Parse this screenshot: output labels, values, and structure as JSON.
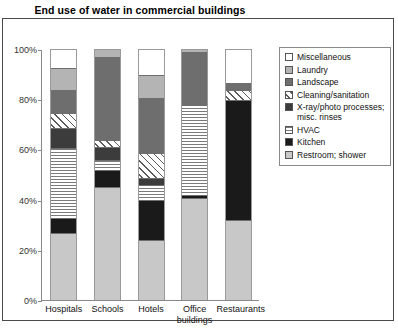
{
  "chart_data": {
    "type": "bar",
    "subtype": "stacked-percent",
    "title": "End use of water in commercial buildings",
    "xlabel": "",
    "ylabel": "",
    "ylim": [
      0,
      100
    ],
    "yticks": [
      "0%",
      "20%",
      "40%",
      "60%",
      "80%",
      "100%"
    ],
    "ytick_values": [
      0,
      20,
      40,
      60,
      80,
      100
    ],
    "grid": false,
    "legend_position": "right",
    "categories": [
      "Hospitals",
      "Schools",
      "Hotels",
      "Office\nbuildings",
      "Restaurants"
    ],
    "series": [
      {
        "name": "Restroom; shower",
        "key": "restroom",
        "values": [
          27,
          45,
          24,
          41,
          32
        ]
      },
      {
        "name": "Kitchen",
        "key": "kitchen",
        "values": [
          6,
          7,
          16,
          1,
          48
        ]
      },
      {
        "name": "HVAC",
        "key": "hvac",
        "values": [
          28,
          4,
          6,
          36,
          0
        ]
      },
      {
        "name": "X-ray/photo processes;\nmisc. rinses",
        "key": "xray",
        "values": [
          8,
          5,
          3,
          0,
          0
        ]
      },
      {
        "name": "Cleaning/sanitation",
        "key": "cleaning",
        "values": [
          6,
          3,
          10,
          0,
          4
        ]
      },
      {
        "name": "Landscape",
        "key": "landscape",
        "values": [
          9,
          33,
          22,
          21,
          3
        ]
      },
      {
        "name": "Laundry",
        "key": "laundry",
        "values": [
          9,
          3,
          9,
          1,
          0
        ]
      },
      {
        "name": "Miscellaneous",
        "key": "misc",
        "values": [
          7,
          0,
          10,
          0,
          13
        ]
      }
    ],
    "legend": [
      {
        "label": "Miscellaneous",
        "key": "misc"
      },
      {
        "label": "Laundry",
        "key": "laundry"
      },
      {
        "label": "Landscape",
        "key": "landscape"
      },
      {
        "label": "Cleaning/sanitation",
        "key": "cleaning"
      },
      {
        "label": "X-ray/photo processes;\nmisc. rinses",
        "key": "xray"
      },
      {
        "label": "HVAC",
        "key": "hvac"
      },
      {
        "label": "Kitchen",
        "key": "kitchen"
      },
      {
        "label": "Restroom; shower",
        "key": "restroom"
      }
    ],
    "colors": {
      "misc": "#ffffff",
      "laundry": "#b4b4b4",
      "landscape": "#6e6e6e",
      "cleaning": "#ffffff",
      "xray": "#3c3c3c",
      "hvac": "#ffffff",
      "kitchen": "#1a1a1a",
      "restroom": "#c8c8c8",
      "axis": "#8a8a8a",
      "frame": "#4a4a4a",
      "text": "#111111"
    }
  }
}
